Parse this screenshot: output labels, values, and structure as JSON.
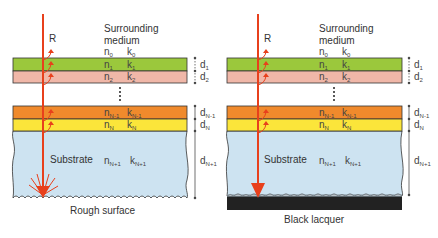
{
  "colors": {
    "ray": "#e8401c",
    "layer1": "#9bc83c",
    "layer2": "#f0b7a8",
    "layerN1": "#f08a2c",
    "layerN": "#fbe53a",
    "substrate": "#cde3f1",
    "lacquer": "#222222",
    "border": "#333333"
  },
  "panels": [
    {
      "ray_label": "R",
      "medium_label_line1": "Surrounding",
      "medium_label_line2": "medium",
      "n0": "n",
      "n0_sub": "0",
      "k0": "k",
      "k0_sub": "0",
      "layers": [
        {
          "n": "n",
          "n_sub": "1",
          "k": "k",
          "k_sub": "1",
          "d": "d",
          "d_sub": "1"
        },
        {
          "n": "n",
          "n_sub": "2",
          "k": "k",
          "k_sub": "2",
          "d": "d",
          "d_sub": "2"
        },
        {
          "n": "n",
          "n_sub": "N-1",
          "k": "k",
          "k_sub": "N-1",
          "d": "d",
          "d_sub": "N-1"
        },
        {
          "n": "n",
          "n_sub": "N",
          "k": "k",
          "k_sub": "N",
          "d": "d",
          "d_sub": "N"
        }
      ],
      "substrate_label": "Substrate",
      "substrate_n": "n",
      "substrate_n_sub": "N+1",
      "substrate_k": "k",
      "substrate_k_sub": "N+1",
      "substrate_d": "d",
      "substrate_d_sub": "N+1",
      "caption": "Rough surface"
    },
    {
      "ray_label": "R",
      "medium_label_line1": "Surrounding",
      "medium_label_line2": "medium",
      "n0": "n",
      "n0_sub": "0",
      "k0": "k",
      "k0_sub": "0",
      "layers": [
        {
          "n": "n",
          "n_sub": "1",
          "k": "k",
          "k_sub": "1",
          "d": "d",
          "d_sub": "1"
        },
        {
          "n": "n",
          "n_sub": "2",
          "k": "k",
          "k_sub": "2",
          "d": "d",
          "d_sub": "2"
        },
        {
          "n": "n",
          "n_sub": "N-1",
          "k": "k",
          "k_sub": "N-1",
          "d": "d",
          "d_sub": "N-1"
        },
        {
          "n": "n",
          "n_sub": "N",
          "k": "k",
          "k_sub": "N",
          "d": "d",
          "d_sub": "N"
        }
      ],
      "substrate_label": "Substrate",
      "substrate_n": "n",
      "substrate_n_sub": "N+1",
      "substrate_k": "k",
      "substrate_k_sub": "N+1",
      "substrate_d": "d",
      "substrate_d_sub": "N+1",
      "caption": "Black lacquer"
    }
  ]
}
